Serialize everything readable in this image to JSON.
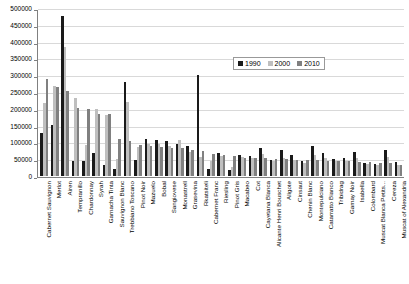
{
  "chart_data": {
    "type": "bar",
    "title": "",
    "xlabel": "",
    "ylabel": "",
    "ylim": [
      0,
      500000
    ],
    "ytick_step": 50000,
    "yticks": [
      0,
      50000,
      100000,
      150000,
      200000,
      250000,
      300000,
      350000,
      400000,
      450000,
      500000
    ],
    "grid": true,
    "legend_position": "top-right",
    "categories": [
      "Cabernet Sauvignon",
      "Merlot",
      "Airen",
      "Tempranillo",
      "Chardonnay",
      "Syrah",
      "Garnacha Tinta",
      "Sauvignon Blanc",
      "Trebbiano Toscano",
      "Pinot Noir",
      "Mazuelo",
      "Bobal",
      "Sangiovese",
      "Monastrell",
      "Grasevina",
      "Rkatsiteli",
      "Cabernet Franc",
      "Riesling",
      "Pinot Gris",
      "Macabeo",
      "Cot",
      "Cayetana Blanca",
      "Alicante Henri Bouschet",
      "Aligote",
      "Cinsaut",
      "Chenin Blanc",
      "Montepulciano",
      "Catarratto Bianco",
      "Tribidrag",
      "Gamay Noir",
      "Isabella",
      "Colombard",
      "Muscat Blanca Petits...",
      "Cereza",
      "Muscat of Alexandria"
    ],
    "series": [
      {
        "name": "1990",
        "color": "#1a1a1a",
        "values": [
          127000,
          152000,
          476000,
          46000,
          45000,
          69000,
          34000,
          20000,
          280000,
          47000,
          111000,
          106000,
          105000,
          96000,
          88000,
          300000,
          22000,
          68000,
          18000,
          63000,
          59000,
          84000,
          48000,
          76000,
          62000,
          45000,
          89000,
          68000,
          50000,
          53000,
          72000,
          39000,
          36000,
          78000,
          42000
        ]
      },
      {
        "name": "2000",
        "color": "#bfbfbf",
        "values": [
          218000,
          267000,
          385000,
          231000,
          92000,
          198000,
          182000,
          52000,
          220000,
          86000,
          94000,
          96000,
          88000,
          108000,
          72000,
          58000,
          46000,
          60000,
          26000,
          56000,
          54000,
          66000,
          44000,
          55000,
          48000,
          40000,
          64000,
          54000,
          44000,
          46000,
          54000,
          36000,
          32000,
          56000,
          34000
        ]
      },
      {
        "name": "2010",
        "color": "#808080",
        "values": [
          290000,
          266000,
          252000,
          203000,
          199000,
          185000,
          184000,
          111000,
          104000,
          92000,
          88000,
          85000,
          84000,
          82000,
          78000,
          74000,
          66000,
          63000,
          59000,
          55000,
          54000,
          53000,
          52000,
          50000,
          49000,
          48000,
          47000,
          46000,
          45000,
          44000,
          43000,
          41000,
          40000,
          38000,
          33000
        ]
      }
    ],
    "legend": [
      {
        "label": "1990",
        "color": "#1a1a1a"
      },
      {
        "label": "2000",
        "color": "#bfbfbf"
      },
      {
        "label": "2010",
        "color": "#808080"
      }
    ]
  }
}
